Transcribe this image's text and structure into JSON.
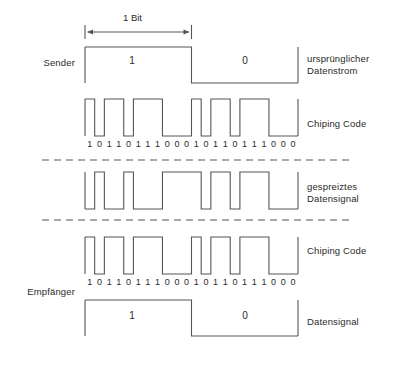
{
  "figure": {
    "title_measure": "1 Bit",
    "background": "#ffffff",
    "stroke_color": "#555555",
    "text_color": "#2a2a2a"
  },
  "side_labels": {
    "sender": "Sender",
    "empfaenger": "Empfänger"
  },
  "right_labels": {
    "original_data_stream_line1": "ursprünglicher",
    "original_data_stream_line2": "Datenstrom",
    "chiping_code_top": "Chiping Code",
    "spread_signal_line1": "gespreiztes",
    "spread_signal_line2": "Datensignal",
    "chiping_code_bottom": "Chiping Code",
    "data_signal": "Datensignal"
  },
  "data_values": {
    "bit_one": "1",
    "bit_zero": "0"
  },
  "chart_data": {
    "type": "line",
    "xlabel": "",
    "ylabel": "",
    "x_span_px": [
      85,
      298
    ],
    "chip_count": 22,
    "signals": [
      {
        "name": "ursprünglicher Datenstrom",
        "row": "sender",
        "type": "data",
        "bits": [
          1,
          0
        ],
        "samples": [
          1,
          1,
          1,
          1,
          1,
          1,
          1,
          1,
          1,
          1,
          1,
          0,
          0,
          0,
          0,
          0,
          0,
          0,
          0,
          0,
          0,
          0
        ]
      },
      {
        "name": "Chiping Code (Sender)",
        "row": "sender",
        "type": "chip",
        "bit_labels": [
          "1",
          "0",
          "1",
          "1",
          "0",
          "1",
          "1",
          "1",
          "0",
          "0",
          "0",
          "1",
          "0",
          "1",
          "1",
          "0",
          "1",
          "1",
          "1",
          "0",
          "0",
          "0"
        ],
        "samples": [
          1,
          0,
          1,
          1,
          0,
          1,
          1,
          1,
          0,
          0,
          0,
          1,
          0,
          1,
          1,
          0,
          1,
          1,
          1,
          0,
          0,
          0
        ]
      },
      {
        "name": "gespreiztes Datensignal",
        "row": "channel",
        "type": "spread",
        "samples": [
          0,
          1,
          0,
          0,
          1,
          0,
          0,
          0,
          1,
          1,
          1,
          1,
          0,
          1,
          1,
          0,
          1,
          1,
          1,
          0,
          0,
          0
        ]
      },
      {
        "name": "Chiping Code (Empfänger)",
        "row": "empfaenger",
        "type": "chip",
        "bit_labels": [
          "1",
          "0",
          "1",
          "1",
          "0",
          "1",
          "1",
          "1",
          "0",
          "0",
          "0",
          "1",
          "0",
          "1",
          "1",
          "0",
          "1",
          "1",
          "1",
          "0",
          "0",
          "0"
        ],
        "samples": [
          1,
          0,
          1,
          1,
          0,
          1,
          1,
          1,
          0,
          0,
          0,
          1,
          0,
          1,
          1,
          0,
          1,
          1,
          1,
          0,
          0,
          0
        ]
      },
      {
        "name": "Datensignal",
        "row": "empfaenger",
        "type": "data",
        "bits": [
          1,
          0
        ],
        "samples": [
          1,
          1,
          1,
          1,
          1,
          1,
          1,
          1,
          1,
          1,
          1,
          0,
          0,
          0,
          0,
          0,
          0,
          0,
          0,
          0,
          0,
          0
        ]
      }
    ],
    "separators": [
      {
        "name": "dashed-separator-upper",
        "y": 160
      },
      {
        "name": "dashed-separator-lower",
        "y": 220
      }
    ],
    "grid": false,
    "legend": "none"
  }
}
